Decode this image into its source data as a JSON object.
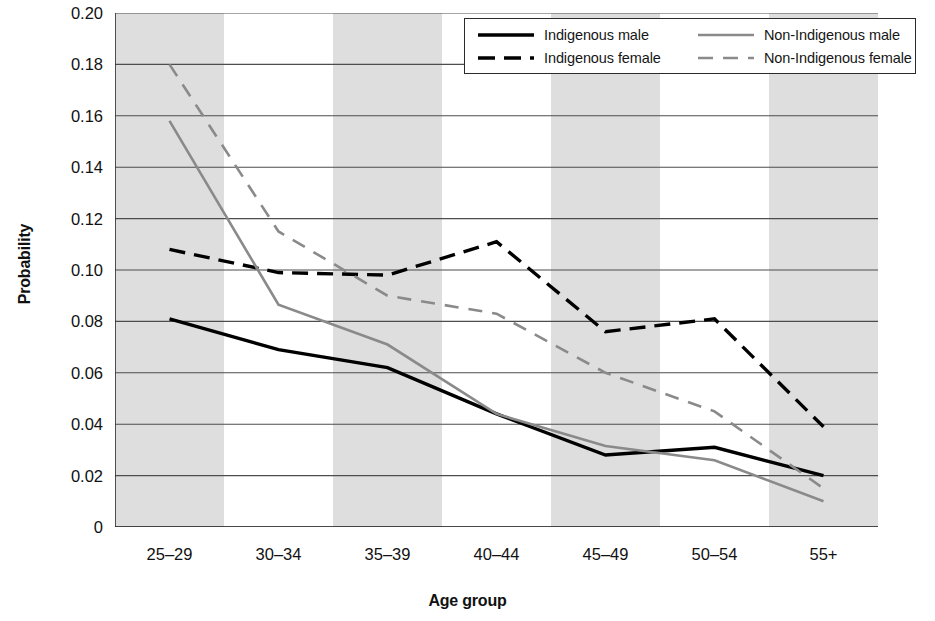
{
  "chart_data": {
    "type": "line",
    "title": "",
    "xlabel": "Age group",
    "ylabel": "Probability",
    "categories": [
      "25–29",
      "30–34",
      "35–39",
      "40–44",
      "45–49",
      "50–54",
      "55+"
    ],
    "ylim": [
      0,
      0.2
    ],
    "ytick_labels": [
      "0",
      "0.02",
      "0.04",
      "0.06",
      "0.08",
      "0.10",
      "0.12",
      "0.14",
      "0.16",
      "0.18",
      "0.20"
    ],
    "ytick_values": [
      0,
      0.02,
      0.04,
      0.06,
      0.08,
      0.1,
      0.12,
      0.14,
      0.16,
      0.18,
      0.2
    ],
    "grid": "horizontal",
    "banding": "alternating vertical grey bands per age group",
    "legend_position": "top-right inside plot",
    "series": [
      {
        "name": "Indigenous male",
        "style": "solid",
        "color": "#000000",
        "width": 3.4,
        "values": [
          0.081,
          0.069,
          0.062,
          0.044,
          0.028,
          0.031,
          0.02
        ]
      },
      {
        "name": "Indigenous female",
        "style": "dashed",
        "color": "#000000",
        "width": 3.4,
        "values": [
          0.108,
          0.099,
          0.098,
          0.111,
          0.076,
          0.081,
          0.039
        ]
      },
      {
        "name": "Non-Indigenous male",
        "style": "solid",
        "color": "#8a8a8a",
        "width": 2.6,
        "values": [
          0.158,
          0.0865,
          0.071,
          0.044,
          0.0315,
          0.026,
          0.01
        ]
      },
      {
        "name": "Non-Indigenous female",
        "style": "dashed",
        "color": "#8a8a8a",
        "width": 2.6,
        "values": [
          0.18,
          0.115,
          0.09,
          0.083,
          0.06,
          0.045,
          0.015
        ]
      }
    ]
  },
  "colors": {
    "band": "#dedede",
    "grid": "#4d4d4d",
    "axis": "#2b2b2b",
    "indigenous": "#000000",
    "non_indigenous": "#8a8a8a"
  }
}
